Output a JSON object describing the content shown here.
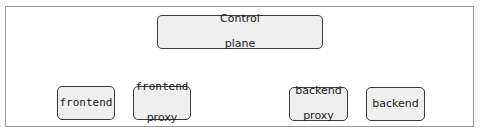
{
  "diagram": {
    "nodes": [
      {
        "id": "control-plane",
        "lines": [
          "Control",
          "plane"
        ]
      },
      {
        "id": "frontend",
        "lines": [
          "frontend"
        ]
      },
      {
        "id": "frontend-proxy",
        "lines": [
          "frontend",
          "proxy"
        ]
      },
      {
        "id": "backend-proxy",
        "lines": [
          "backend",
          "proxy"
        ]
      },
      {
        "id": "backend",
        "lines": [
          "backend"
        ]
      }
    ],
    "colors": {
      "node_fill": "#efefef",
      "node_border": "#3a3a3a",
      "frame_border": "#9a9a9a",
      "text": "#1a1a1a"
    }
  }
}
